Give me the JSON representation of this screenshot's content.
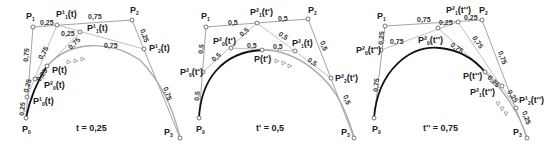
{
  "diagram": {
    "panels": [
      {
        "id": "panel-t",
        "caption": "t = 0,25",
        "parameter": 0.25,
        "points": {
          "P0": {
            "label": "P",
            "sub": "0",
            "x": 26,
            "y": 118
          },
          "P1": {
            "label": "P",
            "sub": "1",
            "x": 33,
            "y": 27
          },
          "P2": {
            "label": "P",
            "sub": "2",
            "x": 132,
            "y": 20
          },
          "P3": {
            "label": "P",
            "sub": "3",
            "x": 180,
            "y": 138
          },
          "P10": {
            "label": "P¹",
            "sub": "0",
            "arg": "(t)",
            "x": 27,
            "y": 97
          },
          "P11": {
            "label": "P¹",
            "sub": "1",
            "arg": "(t)",
            "x": 57,
            "y": 25
          },
          "P12": {
            "label": "P¹",
            "sub": "2",
            "arg": "(t)",
            "x": 144,
            "y": 49
          },
          "P20": {
            "label": "P²",
            "sub": "0",
            "arg": "(t)",
            "x": 35,
            "y": 79
          },
          "P21": {
            "label": "P¹",
            "sub": "1",
            "arg": "(t)",
            "x": 80,
            "y": 32
          },
          "Pt": {
            "label": "P(t)",
            "x": 47,
            "y": 66
          }
        },
        "segment_labels": [
          "0,25",
          "0,75",
          "0,75",
          "0,25",
          "0,25",
          "0,75",
          "0,75",
          "0,25",
          "0,25",
          "0,75",
          "0,25",
          "0,75"
        ]
      },
      {
        "id": "panel-t-prime",
        "caption": "t' = 0,5",
        "parameter": 0.5,
        "points": {
          "P0": {
            "label": "P",
            "sub": "0",
            "x": 199,
            "y": 118
          },
          "P1": {
            "label": "P",
            "sub": "1",
            "x": 206,
            "y": 27
          },
          "P2": {
            "label": "P",
            "sub": "2",
            "x": 308,
            "y": 19
          },
          "P3": {
            "label": "P",
            "sub": "3",
            "x": 354,
            "y": 138
          },
          "P10": {
            "label": "P²",
            "sub": "0",
            "arg": "(t')",
            "x": 203,
            "y": 72
          },
          "P11": {
            "label": "P²",
            "sub": "1",
            "arg": "(t')",
            "x": 257,
            "y": 23
          },
          "P12": {
            "label": "P²",
            "sub": "2",
            "arg": "(t')",
            "x": 331,
            "y": 78
          },
          "P20": {
            "label": "P²",
            "sub": "0",
            "arg": "(t')",
            "x": 231,
            "y": 48
          },
          "P21": {
            "label": "P²",
            "sub": "1",
            "arg": "(t')",
            "x": 295,
            "y": 51
          },
          "Pt": {
            "label": "P(t')",
            "x": 262,
            "y": 50
          }
        },
        "segment_labels": [
          "0,5",
          "0,5",
          "0,5",
          "0,5",
          "0,5",
          "0,5",
          "0,5",
          "0,5",
          "0,5",
          "0,5",
          "0,5",
          "0,5"
        ]
      },
      {
        "id": "panel-t-double-prime",
        "caption": "t'' = 0,75",
        "parameter": 0.75,
        "points": {
          "P0": {
            "label": "P",
            "sub": "0",
            "x": 374,
            "y": 118
          },
          "P1": {
            "label": "P",
            "sub": "1",
            "x": 385,
            "y": 26
          },
          "P2": {
            "label": "P",
            "sub": "2",
            "x": 482,
            "y": 20
          },
          "P3": {
            "label": "P",
            "sub": "3",
            "x": 527,
            "y": 138
          },
          "P10": {
            "label": "P²",
            "sub": "0",
            "arg": "(t'')",
            "x": 381,
            "y": 50
          },
          "P11": {
            "label": "P²",
            "sub": "1",
            "arg": "(t'')",
            "x": 458,
            "y": 22
          },
          "P12": {
            "label": "P¹",
            "sub": "2",
            "arg": "(t'')",
            "x": 516,
            "y": 108
          },
          "P20": {
            "label": "P²",
            "sub": "0",
            "arg": "(t'')",
            "x": 438,
            "y": 28
          },
          "P21": {
            "label": "P²",
            "sub": "1",
            "arg": "(t'')",
            "x": 502,
            "y": 86
          },
          "Pt": {
            "label": "P(t'')",
            "x": 485,
            "y": 72
          }
        },
        "segment_labels": [
          "0,75",
          "0,25",
          "0,75",
          "0,25",
          "0,75",
          "0,25",
          "0,75",
          "0,25",
          "0,75",
          "0,25",
          "0,75",
          "0,25"
        ]
      }
    ]
  },
  "text": {
    "p1": {
      "P0": "P",
      "P0s": "0",
      "P1": "P",
      "P1s": "1",
      "P2": "P",
      "P2s": "2",
      "P3": "P",
      "P3s": "3",
      "P11": "P¹",
      "P11s": "1",
      "P11a": "(t)",
      "P21": "P¹",
      "P21s": "1",
      "P21a": "(t)",
      "P12": "P¹",
      "P12s": "2",
      "P12a": "(t)",
      "Pt": "P(t)",
      "P20": "P²",
      "P20s": "0",
      "P20a": "(t)",
      "P10": "P¹",
      "P10s": "0",
      "P10a": "(t)",
      "cap": "t = 0,25",
      "s_p1p11": "0,25",
      "s_p11p2": "0,75",
      "s_p0p1": "0,75",
      "s_p2p3a": "0,25",
      "s_p2p3b": "0,75",
      "s_p11p21": "0,25",
      "s_p21p12": "0,75",
      "s_p10p11": "0,75",
      "s_p20p21": "0,75",
      "s_p0p10": "0,25",
      "s_p10p20": "0,25",
      "s_p20pt": "0,25"
    },
    "p2": {
      "P0": "P",
      "P0s": "0",
      "P1": "P",
      "P1s": "1",
      "P2": "P",
      "P2s": "2",
      "P3": "P",
      "P3s": "3",
      "P11": "P²",
      "P11s": "1",
      "P11a": "(t')",
      "P21": "P²",
      "P21s": "1",
      "P21a": "(t)",
      "P12": "P²",
      "P12s": "2",
      "P12a": "(t')",
      "Pt": "P(t')",
      "P20": "P²",
      "P20s": "0",
      "P20a": "(t')",
      "P10": "P²",
      "P10s": "0",
      "P10a": "(t')",
      "cap": "t' = 0,5",
      "s_p1p11": "0,5",
      "s_p11p2": "0,5",
      "s_p0p1a": "0,5",
      "s_p0p1b": "0,5",
      "s_p2p3a": "0,5",
      "s_p2p3b": "0,5",
      "s_p11p21": "0,5",
      "s_p21p12": "0,5",
      "s_p10p20": "0,5",
      "s_p20p11": "0,5",
      "s_p20pt": "0,5",
      "s_ptp21": "0,5"
    },
    "p3": {
      "P0": "P",
      "P0s": "0",
      "P1": "P",
      "P1s": "1",
      "P2": "P",
      "P2s": "2",
      "P3": "P",
      "P3s": "3",
      "P11": "P²",
      "P11s": "1",
      "P11a": "(t'')",
      "P21": "P²",
      "P21s": "1",
      "P21a": "(t'')",
      "P12": "P¹",
      "P12s": "2",
      "P12a": "(t'')",
      "Pt": "P(t'')",
      "P20": "P²",
      "P20s": "0",
      "P20a": "(t'')",
      "P10": "P²",
      "P10s": "0",
      "P10a": "(t'')",
      "cap": "t'' = 0,75",
      "s_p1p11": "0,75",
      "s_p11p2": "0,25",
      "s_p0p1a": "0,75",
      "s_p0p1b": "0,25",
      "s_p10p20": "0,75",
      "s_p20p11": "0,25",
      "s_p11p21": "0,75",
      "s_p2p3a": "0,75",
      "s_p2p3b": "0,25",
      "s_p20pt": "0,75",
      "s_ptp21": "0,25",
      "s_p21p12": "0,25"
    }
  },
  "colors": {
    "control_polygon": "#9a9a9a",
    "construction_lines": "#b8b8b8",
    "curve_traced": "#111111",
    "curve_remaining": "#a8a8a8",
    "text": "#222222"
  }
}
